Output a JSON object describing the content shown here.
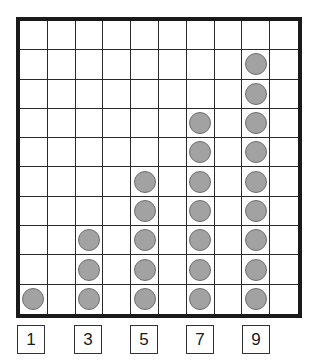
{
  "figure": {
    "type": "counter-grid",
    "grid": {
      "columns": 10,
      "rows": 10
    },
    "colors": {
      "border": "#1a1a1a",
      "grid_line": "#2a2a2a",
      "counter_fill": "#a2a2a2",
      "counter_outline": "#6e6e6e"
    }
  },
  "chart_data": {
    "type": "bar",
    "title": "",
    "xlabel": "",
    "ylabel": "",
    "categories": [
      "1",
      "3",
      "5",
      "7",
      "9"
    ],
    "values": [
      1,
      3,
      5,
      7,
      9
    ],
    "column_indices": [
      0,
      2,
      4,
      6,
      8
    ],
    "ylim": [
      0,
      10
    ],
    "grid": true
  },
  "labels": [
    {
      "text": "1",
      "left": 17
    },
    {
      "text": "3",
      "left": 74
    },
    {
      "text": "5",
      "left": 130
    },
    {
      "text": "7",
      "left": 186
    },
    {
      "text": "9",
      "left": 242
    }
  ]
}
